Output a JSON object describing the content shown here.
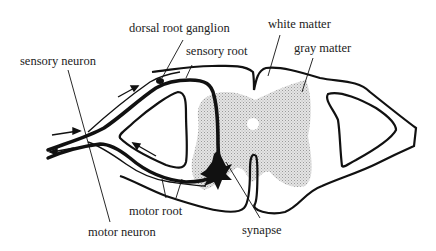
{
  "diagram": {
    "labels": {
      "dorsal_root_ganglion": "dorsal root ganglion",
      "sensory_root": "sensory root",
      "white_matter": "white matter",
      "gray_matter": "gray matter",
      "sensory_neuron": "sensory neuron",
      "motor_root": "motor root",
      "motor_neuron": "motor neuron",
      "synapse": "synapse"
    },
    "colors": {
      "ink": "#111111",
      "gray_matter_fill": "#d6d6d6",
      "text": "#222222",
      "background": "#ffffff"
    }
  }
}
